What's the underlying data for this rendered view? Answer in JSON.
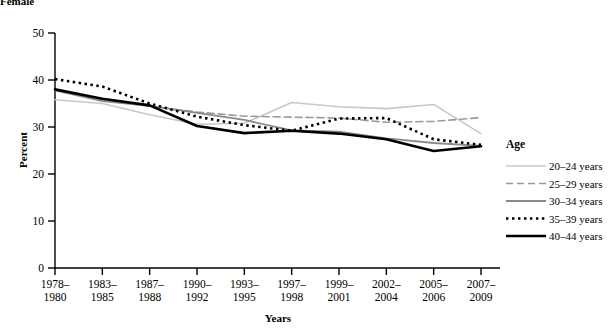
{
  "figure": {
    "cropped_top_text": "Female"
  },
  "axes": {
    "ylabel": "Percent",
    "xlabel": "Years",
    "yticks": [
      "0",
      "10",
      "20",
      "30",
      "40",
      "50"
    ],
    "xticks": [
      {
        "line1": "1978–",
        "line2": "1980"
      },
      {
        "line1": "1983–",
        "line2": "1985"
      },
      {
        "line1": "1987–",
        "line2": "1988"
      },
      {
        "line1": "1990–",
        "line2": "1992"
      },
      {
        "line1": "1993–",
        "line2": "1995"
      },
      {
        "line1": "1997–",
        "line2": "1998"
      },
      {
        "line1": "1999–",
        "line2": "2001"
      },
      {
        "line1": "2002–",
        "line2": "2004"
      },
      {
        "line1": "2005–",
        "line2": "2006"
      },
      {
        "line1": "2007–",
        "line2": "2009"
      }
    ]
  },
  "legend": {
    "title": "Age",
    "position": "right",
    "entries": [
      {
        "label": "20–24 years",
        "color": "#c8c8c8",
        "style": "solid",
        "width": 1.6
      },
      {
        "label": "25–29 years",
        "color": "#9a9a9a",
        "style": "dashed",
        "width": 1.6
      },
      {
        "label": "30–34 years",
        "color": "#8a8a8a",
        "style": "solid",
        "width": 1.8
      },
      {
        "label": "35–39 years",
        "color": "#000000",
        "style": "dotted",
        "width": 2.6
      },
      {
        "label": "40–44 years",
        "color": "#000000",
        "style": "solid",
        "width": 2.6
      }
    ]
  },
  "chart_data": {
    "type": "line",
    "title": "",
    "xlabel": "Years",
    "ylabel": "Percent",
    "ylim": [
      0,
      50
    ],
    "yticks": [
      0,
      10,
      20,
      30,
      40,
      50
    ],
    "grid": false,
    "legend_position": "right",
    "legend_title": "Age",
    "categories": [
      "1978–1980",
      "1983–1985",
      "1987–1988",
      "1990–1992",
      "1993–1995",
      "1997–1998",
      "1999–2001",
      "2002–2004",
      "2005–2006",
      "2007–2009"
    ],
    "series": [
      {
        "name": "20–24 years",
        "color": "#c8c8c8",
        "style": "solid",
        "values": [
          35.8,
          35.0,
          32.6,
          30.6,
          30.8,
          35.2,
          34.3,
          33.9,
          34.8,
          28.6
        ]
      },
      {
        "name": "25–29 years",
        "color": "#9a9a9a",
        "style": "dashed",
        "values": [
          37.8,
          35.8,
          34.4,
          33.2,
          32.3,
          32.1,
          31.9,
          31.0,
          31.2,
          32.0
        ]
      },
      {
        "name": "30–34 years",
        "color": "#8a8a8a",
        "style": "solid",
        "values": [
          37.8,
          35.5,
          34.5,
          33.0,
          31.5,
          29.3,
          29.0,
          27.6,
          26.6,
          26.0
        ]
      },
      {
        "name": "35–39 years",
        "color": "#000000",
        "style": "dotted",
        "values": [
          40.2,
          38.6,
          35.0,
          32.2,
          30.4,
          29.2,
          31.8,
          31.9,
          27.4,
          26.2
        ]
      },
      {
        "name": "40–44 years",
        "color": "#000000",
        "style": "solid",
        "values": [
          38.0,
          36.0,
          34.6,
          30.2,
          28.7,
          29.2,
          28.6,
          27.4,
          24.9,
          25.9
        ]
      }
    ]
  }
}
